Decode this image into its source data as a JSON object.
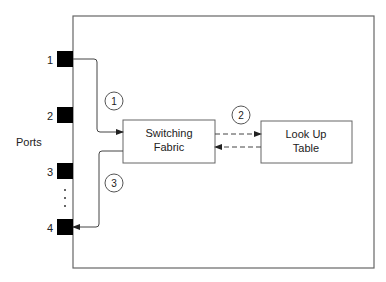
{
  "diagram": {
    "ports_label": "Ports",
    "ports": [
      {
        "label": "1"
      },
      {
        "label": "2"
      },
      {
        "label": "3"
      },
      {
        "label": "4"
      }
    ],
    "ellipsis": "⋮",
    "boxes": {
      "switching_fabric": {
        "line1": "Switching",
        "line2": "Fabric"
      },
      "lookup_table": {
        "line1": "Look Up",
        "line2": "Table"
      }
    },
    "steps": [
      {
        "label": "1"
      },
      {
        "label": "2"
      },
      {
        "label": "3"
      }
    ],
    "colors": {
      "line": "#555555",
      "port": "#000000",
      "text": "#222222"
    }
  }
}
